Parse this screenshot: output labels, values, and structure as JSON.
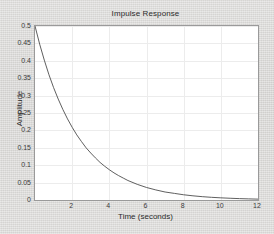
{
  "chart_data": {
    "type": "line",
    "title": "Impulse Response",
    "xlabel": "Time (seconds)",
    "ylabel": "Amplitude",
    "xlim": [
      0,
      12
    ],
    "ylim": [
      0,
      0.5
    ],
    "grid": true,
    "legend": null,
    "xticks": [
      0,
      2,
      4,
      6,
      8,
      10,
      12
    ],
    "xtick_labels": [
      "",
      "2",
      "4",
      "6",
      "8",
      "10",
      "12"
    ],
    "yticks": [
      0,
      0.05,
      0.1,
      0.15,
      0.2,
      0.25,
      0.3,
      0.35,
      0.4,
      0.45,
      0.5
    ],
    "ytick_labels": [
      "0",
      "0.05",
      "0.1",
      "0.15",
      "0.2",
      "0.25",
      "0.3",
      "0.35",
      "0.4",
      "0.45",
      "0.5"
    ],
    "series": [
      {
        "name": "impulse response",
        "color": "#4d4d4d",
        "x": [
          0,
          0.25,
          0.5,
          0.75,
          1,
          1.25,
          1.5,
          1.75,
          2,
          2.25,
          2.5,
          2.75,
          3,
          3.25,
          3.5,
          3.75,
          4,
          4.25,
          4.5,
          4.75,
          5,
          5.5,
          6,
          6.5,
          7,
          7.5,
          8,
          8.5,
          9,
          9.5,
          10,
          10.5,
          11,
          11.5,
          12
        ],
        "y": [
          0.5,
          0.448,
          0.402,
          0.36,
          0.323,
          0.29,
          0.26,
          0.233,
          0.209,
          0.187,
          0.168,
          0.15,
          0.135,
          0.121,
          0.108,
          0.097,
          0.087,
          0.078,
          0.07,
          0.063,
          0.056,
          0.045,
          0.036,
          0.029,
          0.023,
          0.019,
          0.015,
          0.012,
          0.0096,
          0.0077,
          0.0062,
          0.005,
          0.004,
          0.0032,
          0.0025
        ]
      }
    ]
  },
  "figure": {
    "background_color": "#d8d7d5",
    "axes_background": "#ffffff",
    "axes_border_color": "#9a9a9a",
    "grid_color": "#ececec",
    "line_color": "#4d4d4d"
  }
}
